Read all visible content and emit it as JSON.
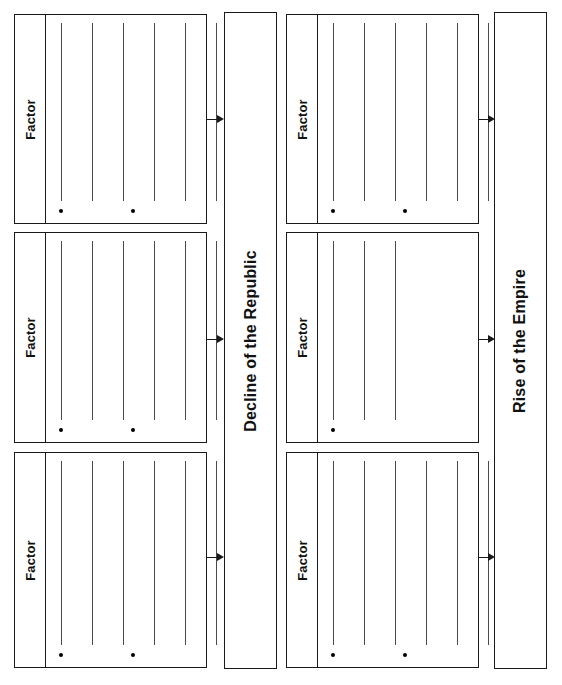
{
  "worksheet": {
    "title": "Cause and Effect Graphic Organizer",
    "orientation": "landscape-rotated",
    "columns": [
      {
        "id": "left-column",
        "outcome": {
          "id": "decline-of-the-republic",
          "label": "Decline of the Republic",
          "box": {
            "x": 224,
            "y": 12,
            "w": 53,
            "h": 657
          }
        },
        "factors": [
          {
            "id": "left-factor-1",
            "label": "Factor",
            "box": {
              "x": 14,
              "y": 14,
              "w": 193,
              "h": 210
            },
            "rule_count": 6,
            "bullet_count": 2,
            "arrow": {
              "x": 207,
              "y": 114,
              "length": 17
            }
          },
          {
            "id": "left-factor-2",
            "label": "Factor",
            "box": {
              "x": 14,
              "y": 232,
              "w": 193,
              "h": 211
            },
            "rule_count": 6,
            "bullet_count": 2,
            "arrow": {
              "x": 207,
              "y": 334,
              "length": 17
            }
          },
          {
            "id": "left-factor-3",
            "label": "Factor",
            "box": {
              "x": 14,
              "y": 452,
              "w": 193,
              "h": 216
            },
            "rule_count": 6,
            "bullet_count": 2,
            "arrow": {
              "x": 207,
              "y": 552,
              "length": 17
            }
          }
        ]
      },
      {
        "id": "right-column",
        "outcome": {
          "id": "rise-of-the-empire",
          "label": "Rise of the Empire",
          "box": {
            "x": 494,
            "y": 12,
            "w": 53,
            "h": 657
          }
        },
        "factors": [
          {
            "id": "right-factor-1",
            "label": "Factor",
            "box": {
              "x": 286,
              "y": 14,
              "w": 193,
              "h": 210
            },
            "rule_count": 6,
            "bullet_count": 2,
            "arrow": {
              "x": 479,
              "y": 114,
              "length": 16
            }
          },
          {
            "id": "right-factor-2",
            "label": "Factor",
            "box": {
              "x": 286,
              "y": 232,
              "w": 193,
              "h": 211
            },
            "rule_count": 3,
            "bullet_count": 1,
            "arrow": {
              "x": 479,
              "y": 334,
              "length": 16
            }
          },
          {
            "id": "right-factor-3",
            "label": "Factor",
            "box": {
              "x": 286,
              "y": 452,
              "w": 193,
              "h": 216
            },
            "rule_count": 6,
            "bullet_count": 2,
            "arrow": {
              "x": 479,
              "y": 552,
              "length": 16
            }
          }
        ]
      }
    ],
    "colors": {
      "border": "#1a1a1a",
      "rule": "#4a4a4a",
      "bullet": "#000000",
      "text": "#111111",
      "background": "#ffffff"
    }
  }
}
